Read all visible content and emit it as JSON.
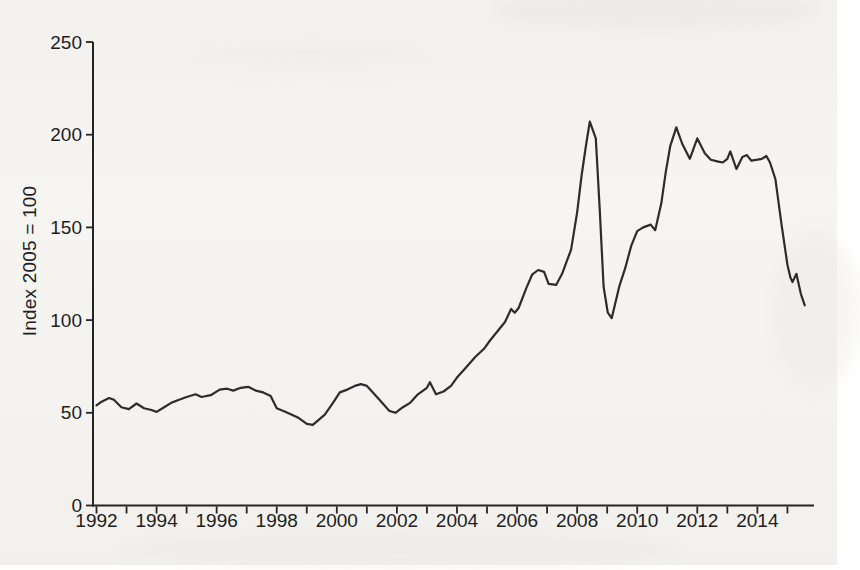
{
  "chart_data": {
    "type": "line",
    "title": "",
    "xlabel": "",
    "ylabel": "Index 2005 = 100",
    "xlim": [
      1992,
      2016
    ],
    "ylim": [
      0,
      250
    ],
    "grid": false,
    "legend": "none",
    "line_color": "#2c2c2c",
    "axis_color": "#242424",
    "text_color": "#1d1d1d",
    "yticks": [
      0,
      50,
      100,
      150,
      200,
      250
    ],
    "xticks": [
      1992,
      1993,
      1994,
      1995,
      1996,
      1997,
      1998,
      1999,
      2000,
      2001,
      2002,
      2003,
      2004,
      2005,
      2006,
      2007,
      2008,
      2009,
      2010,
      2011,
      2012,
      2013,
      2014,
      2015
    ],
    "xticks_labeled": [
      1992,
      1994,
      1996,
      1998,
      2000,
      2002,
      2004,
      2006,
      2008,
      2010,
      2012,
      2014
    ],
    "series": [
      {
        "points": [
          [
            1992.0,
            54
          ],
          [
            1992.17,
            56
          ],
          [
            1992.42,
            58
          ],
          [
            1992.58,
            57
          ],
          [
            1992.83,
            53
          ],
          [
            1993.08,
            52
          ],
          [
            1993.33,
            55
          ],
          [
            1993.58,
            52.5
          ],
          [
            1993.83,
            51.5
          ],
          [
            1994.0,
            50.5
          ],
          [
            1994.25,
            53
          ],
          [
            1994.5,
            55.5
          ],
          [
            1994.75,
            57
          ],
          [
            1995.0,
            58.5
          ],
          [
            1995.3,
            60
          ],
          [
            1995.5,
            58.5
          ],
          [
            1995.8,
            59.5
          ],
          [
            1996.1,
            62.5
          ],
          [
            1996.35,
            63
          ],
          [
            1996.55,
            62
          ],
          [
            1996.8,
            63.5
          ],
          [
            1997.05,
            64
          ],
          [
            1997.3,
            62
          ],
          [
            1997.55,
            61
          ],
          [
            1997.8,
            59
          ],
          [
            1998.0,
            52.5
          ],
          [
            1998.3,
            50.5
          ],
          [
            1998.7,
            47.5
          ],
          [
            1999.0,
            44
          ],
          [
            1999.2,
            43.5
          ],
          [
            1999.6,
            49
          ],
          [
            1999.9,
            56
          ],
          [
            2000.1,
            61
          ],
          [
            2000.35,
            62.5
          ],
          [
            2000.6,
            64.5
          ],
          [
            2000.8,
            65.5
          ],
          [
            2001.0,
            64.5
          ],
          [
            2001.2,
            61
          ],
          [
            2001.5,
            55.5
          ],
          [
            2001.75,
            51
          ],
          [
            2001.95,
            50
          ],
          [
            2002.2,
            53
          ],
          [
            2002.45,
            55.5
          ],
          [
            2002.7,
            60
          ],
          [
            2003.0,
            63.5
          ],
          [
            2003.1,
            66.5
          ],
          [
            2003.3,
            60
          ],
          [
            2003.55,
            61.5
          ],
          [
            2003.8,
            64.5
          ],
          [
            2004.0,
            69
          ],
          [
            2004.3,
            74.5
          ],
          [
            2004.6,
            80
          ],
          [
            2004.9,
            84.5
          ],
          [
            2005.1,
            89
          ],
          [
            2005.35,
            94
          ],
          [
            2005.6,
            99
          ],
          [
            2005.8,
            106
          ],
          [
            2005.92,
            104
          ],
          [
            2006.05,
            106.5
          ],
          [
            2006.3,
            117
          ],
          [
            2006.5,
            124.5
          ],
          [
            2006.7,
            127
          ],
          [
            2006.9,
            126
          ],
          [
            2007.05,
            119.5
          ],
          [
            2007.3,
            119
          ],
          [
            2007.5,
            125
          ],
          [
            2007.65,
            131.5
          ],
          [
            2007.8,
            138
          ],
          [
            2008.0,
            158
          ],
          [
            2008.15,
            178
          ],
          [
            2008.3,
            195
          ],
          [
            2008.42,
            207
          ],
          [
            2008.62,
            198
          ],
          [
            2008.75,
            160
          ],
          [
            2008.88,
            118
          ],
          [
            2009.02,
            104
          ],
          [
            2009.15,
            101
          ],
          [
            2009.4,
            118
          ],
          [
            2009.6,
            128
          ],
          [
            2009.8,
            140
          ],
          [
            2010.0,
            148
          ],
          [
            2010.2,
            150
          ],
          [
            2010.45,
            151.5
          ],
          [
            2010.6,
            148.5
          ],
          [
            2010.8,
            163
          ],
          [
            2010.95,
            180
          ],
          [
            2011.1,
            194
          ],
          [
            2011.3,
            204
          ],
          [
            2011.5,
            195
          ],
          [
            2011.75,
            187
          ],
          [
            2012.0,
            198
          ],
          [
            2012.25,
            190
          ],
          [
            2012.45,
            186.5
          ],
          [
            2012.7,
            185.5
          ],
          [
            2012.85,
            185
          ],
          [
            2013.0,
            187
          ],
          [
            2013.1,
            191
          ],
          [
            2013.3,
            181.5
          ],
          [
            2013.5,
            188
          ],
          [
            2013.65,
            189
          ],
          [
            2013.8,
            186
          ],
          [
            2014.0,
            186.5
          ],
          [
            2014.15,
            187
          ],
          [
            2014.3,
            188.5
          ],
          [
            2014.42,
            185
          ],
          [
            2014.6,
            176
          ],
          [
            2014.8,
            152
          ],
          [
            2015.0,
            130
          ],
          [
            2015.1,
            123
          ],
          [
            2015.17,
            120.5
          ],
          [
            2015.3,
            125
          ],
          [
            2015.45,
            114
          ],
          [
            2015.58,
            108
          ]
        ]
      }
    ]
  }
}
